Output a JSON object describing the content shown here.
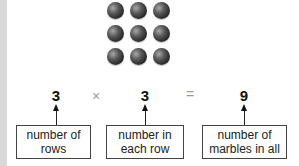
{
  "marbles": {
    "rows": 3,
    "per_row": 3,
    "color": "#3a3a3a"
  },
  "equation": {
    "factor1": "3",
    "times": "×",
    "factor2": "3",
    "equals": "=",
    "product": "9"
  },
  "labels": {
    "rows": {
      "line1": "number of",
      "line2": "rows"
    },
    "each_row": {
      "line1": "number in",
      "line2": "each row"
    },
    "total": {
      "line1": "number of",
      "line2": "marbles in all"
    }
  }
}
